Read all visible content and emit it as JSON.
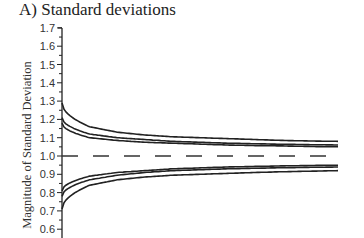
{
  "chart_data": {
    "type": "line",
    "title": "A) Standard deviations",
    "xlabel": "",
    "ylabel": "Magnitude of Standard Deviation",
    "ylim": [
      0.55,
      1.7
    ],
    "yticks": [
      1.7,
      1.6,
      1.5,
      1.4,
      1.3,
      1.2,
      1.1,
      1.0,
      0.9,
      0.8,
      0.7,
      0.6
    ],
    "grid": false,
    "legend": null,
    "x": [
      0,
      0.1,
      0.2,
      0.3,
      0.4,
      0.5,
      0.6,
      0.7,
      0.8,
      0.9,
      1.0
    ],
    "reference_line": {
      "y": 1.0,
      "style": "dashed"
    },
    "series": [
      {
        "name": "upper-1",
        "values": [
          1.29,
          1.16,
          1.13,
          1.115,
          1.105,
          1.1,
          1.095,
          1.09,
          1.085,
          1.082,
          1.08
        ]
      },
      {
        "name": "upper-2",
        "values": [
          1.21,
          1.12,
          1.1,
          1.09,
          1.08,
          1.075,
          1.07,
          1.067,
          1.064,
          1.062,
          1.06
        ]
      },
      {
        "name": "upper-3",
        "values": [
          1.18,
          1.1,
          1.085,
          1.075,
          1.07,
          1.065,
          1.06,
          1.057,
          1.055,
          1.052,
          1.05
        ]
      },
      {
        "name": "lower-1",
        "values": [
          0.81,
          0.89,
          0.91,
          0.92,
          0.93,
          0.935,
          0.94,
          0.943,
          0.946,
          0.948,
          0.95
        ]
      },
      {
        "name": "lower-2",
        "values": [
          0.78,
          0.87,
          0.895,
          0.91,
          0.92,
          0.925,
          0.93,
          0.933,
          0.936,
          0.938,
          0.94
        ]
      },
      {
        "name": "lower-3",
        "values": [
          0.71,
          0.84,
          0.87,
          0.885,
          0.895,
          0.9,
          0.905,
          0.91,
          0.914,
          0.917,
          0.92
        ]
      }
    ]
  }
}
